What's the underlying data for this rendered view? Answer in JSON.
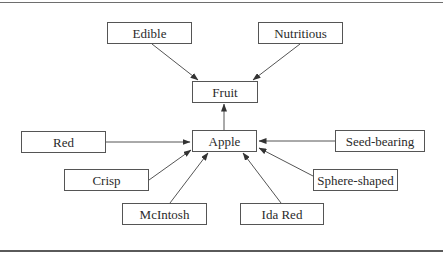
{
  "diagram": {
    "type": "concept-map",
    "colors": {
      "line": "#555555",
      "text": "#2a2a2a",
      "background": "#ffffff"
    },
    "nodes": [
      {
        "id": "edible",
        "label": "Edible",
        "x": 107,
        "y": 22,
        "w": 85,
        "h": 22
      },
      {
        "id": "nutritious",
        "label": "Nutritious",
        "x": 258,
        "y": 22,
        "w": 85,
        "h": 22
      },
      {
        "id": "fruit",
        "label": "Fruit",
        "x": 192,
        "y": 81,
        "w": 66,
        "h": 22
      },
      {
        "id": "apple",
        "label": "Apple",
        "x": 192,
        "y": 130,
        "w": 65,
        "h": 22
      },
      {
        "id": "red",
        "label": "Red",
        "x": 21,
        "y": 131,
        "w": 85,
        "h": 22
      },
      {
        "id": "seed-bearing",
        "label": "Seed-bearing",
        "x": 335,
        "y": 130,
        "w": 90,
        "h": 22
      },
      {
        "id": "crisp",
        "label": "Crisp",
        "x": 64,
        "y": 169,
        "w": 85,
        "h": 22
      },
      {
        "id": "sphere-shaped",
        "label": "Sphere-shaped",
        "x": 313,
        "y": 169,
        "w": 85,
        "h": 22
      },
      {
        "id": "mcintosh",
        "label": "McIntosh",
        "x": 122,
        "y": 203,
        "w": 85,
        "h": 22
      },
      {
        "id": "ida-red",
        "label": "Ida Red",
        "x": 240,
        "y": 203,
        "w": 84,
        "h": 22
      }
    ],
    "edges": [
      {
        "from": "edible",
        "to": "fruit",
        "x1": 152,
        "y1": 44,
        "x2": 198,
        "y2": 80
      },
      {
        "from": "nutritious",
        "to": "fruit",
        "x1": 300,
        "y1": 44,
        "x2": 253,
        "y2": 80
      },
      {
        "from": "apple",
        "to": "fruit",
        "x1": 224,
        "y1": 130,
        "x2": 224,
        "y2": 104
      },
      {
        "from": "red",
        "to": "apple",
        "x1": 106,
        "y1": 142,
        "x2": 190,
        "y2": 142
      },
      {
        "from": "seed-bearing",
        "to": "apple",
        "x1": 335,
        "y1": 141,
        "x2": 259,
        "y2": 141
      },
      {
        "from": "crisp",
        "to": "apple",
        "x1": 149,
        "y1": 180,
        "x2": 191,
        "y2": 150
      },
      {
        "from": "sphere-shaped",
        "to": "apple",
        "x1": 313,
        "y1": 176,
        "x2": 259,
        "y2": 148
      },
      {
        "from": "mcintosh",
        "to": "apple",
        "x1": 170,
        "y1": 203,
        "x2": 208,
        "y2": 153
      },
      {
        "from": "ida-red",
        "to": "apple",
        "x1": 281,
        "y1": 203,
        "x2": 243,
        "y2": 153
      }
    ]
  }
}
